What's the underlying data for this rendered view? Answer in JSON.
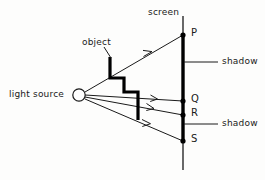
{
  "diagram": {
    "colors": {
      "ink": "#1a1a1a",
      "background": "#fdfdfc",
      "screen": "#000000",
      "object": "#000000",
      "ray": "#1a1a1a"
    },
    "labels": {
      "screen": "screen",
      "object": "object",
      "light_source": "light source",
      "shadow_upper": "shadow",
      "shadow_lower": "shadow",
      "point_p": "P",
      "point_q": "Q",
      "point_r": "R",
      "point_s": "S"
    },
    "elements": {
      "light_source": {
        "name": "light source",
        "shape": "small open circle",
        "x": 79,
        "y": 94,
        "radius": 6
      },
      "screen": {
        "name": "screen",
        "orientation": "vertical",
        "x": 183,
        "y_top": 16,
        "y_bottom": 170,
        "shadow_segment_top": 35,
        "shadow_segment_bottom": 141
      },
      "object": {
        "name": "object",
        "shape": "step",
        "description": "thick stepped outline blocking part of the light"
      },
      "rays": [
        {
          "name": "ray-to-P",
          "from": "light source",
          "to": "P",
          "target_x": 183,
          "target_y": 35
        },
        {
          "name": "ray-to-Q",
          "from": "light source",
          "to": "Q",
          "target_x": 183,
          "target_y": 101
        },
        {
          "name": "ray-to-R",
          "from": "light source",
          "to": "R",
          "target_x": 183,
          "target_y": 115
        },
        {
          "name": "ray-to-S",
          "from": "light source",
          "to": "S",
          "target_x": 183,
          "target_y": 141
        }
      ],
      "marked_points": [
        {
          "label": "P",
          "x": 183,
          "y": 35
        },
        {
          "label": "Q",
          "x": 183,
          "y": 101
        },
        {
          "label": "R",
          "x": 183,
          "y": 115
        },
        {
          "label": "S",
          "x": 183,
          "y": 141
        }
      ],
      "shadow_annotations": [
        {
          "label": "shadow",
          "leader_from_x": 183,
          "leader_y": 62,
          "leader_to_x": 218,
          "text_x": 222
        },
        {
          "label": "shadow",
          "leader_from_x": 183,
          "leader_y": 124,
          "leader_to_x": 218,
          "text_x": 222
        }
      ]
    }
  }
}
